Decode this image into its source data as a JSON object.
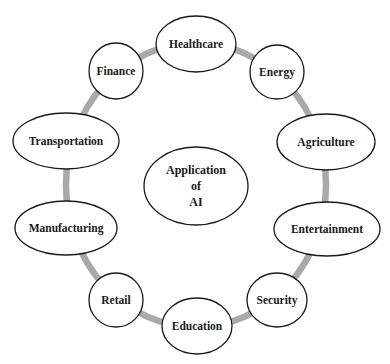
{
  "diagram": {
    "type": "radial-concept-map",
    "ring_color": "#a9a9a9",
    "center": {
      "lines": [
        "Application",
        "of",
        "AI"
      ]
    },
    "nodes": [
      {
        "id": "healthcare",
        "label": "Healthcare"
      },
      {
        "id": "energy",
        "label": "Energy"
      },
      {
        "id": "agriculture",
        "label": "Agriculture"
      },
      {
        "id": "entertainment",
        "label": "Entertainment"
      },
      {
        "id": "security",
        "label": "Security"
      },
      {
        "id": "education",
        "label": "Education"
      },
      {
        "id": "retail",
        "label": "Retail"
      },
      {
        "id": "manufacturing",
        "label": "Manufacturing"
      },
      {
        "id": "transportation",
        "label": "Transportation"
      },
      {
        "id": "finance",
        "label": "Finance"
      }
    ]
  }
}
